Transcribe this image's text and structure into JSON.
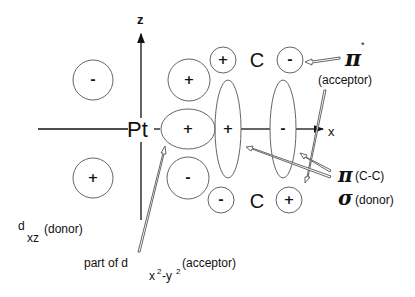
{
  "diagram": {
    "center_atom": "Pt",
    "carbon_label": "C",
    "axes": {
      "z": "z",
      "x": "x"
    },
    "lobes": {
      "dxz_upper_left": "-",
      "dxz_lower_left": "+",
      "pt_upper_right": "+",
      "pt_right": "+",
      "pt_lower_right": "-",
      "cc_sigma_left": "+",
      "cc_sigma_right": "-",
      "pi_star_top_left": "+",
      "pi_star_top_right": "-",
      "pi_star_bottom_left": "-",
      "pi_star_bottom_right": "+"
    },
    "annotations": {
      "pi_star": {
        "symbol": "π",
        "superscript": "*",
        "label": "(acceptor)"
      },
      "pi_cc": {
        "symbol": "π",
        "label": "(C-C)"
      },
      "sigma": {
        "symbol": "σ",
        "label": "(donor)"
      },
      "dxz": {
        "symbol": "d",
        "subscript": "xz",
        "label": "(donor)"
      },
      "dx2y2": {
        "prefix": "part of d",
        "subscript_x": "x",
        "sup1": "2",
        "dash": "-y",
        "sup2": "2",
        "label": "(acceptor)"
      }
    }
  }
}
